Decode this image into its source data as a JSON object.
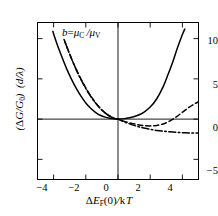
{
  "figure": {
    "annotation": "b = μ_C / μ_V",
    "annotation_parts": {
      "b": "b",
      "eq": "=",
      "mu_c": "μ",
      "sub_c": "C",
      "slash": "/",
      "mu_v": "μ",
      "sub_v": "V"
    },
    "xlabel": "ΔE_F(0) / kT",
    "ylabel": "(ΔG/G₀) (d/λ)"
  },
  "chart_data": {
    "type": "line",
    "title": "",
    "subtitle": "",
    "xlabel": "ΔE_F(0)/kT",
    "ylabel": "(ΔG/G_0)(d/λ)",
    "annotations": [
      "b = μ_C/μ_V"
    ],
    "grid": false,
    "legend": "none",
    "xlim": [
      -5,
      5
    ],
    "ylim": [
      -7.5,
      12
    ],
    "xticks": [
      -4,
      -2,
      0,
      2,
      4
    ],
    "yticks": [
      -5,
      0,
      5,
      10
    ],
    "xtick_labels": [
      "−4",
      "−2",
      "0",
      "2",
      "4"
    ],
    "ytick_labels": [
      "−5",
      "0",
      "5",
      "10"
    ],
    "axis_lines": {
      "x_zero": true,
      "y_zero": true
    },
    "series": [
      {
        "name": "solid",
        "style": "solid",
        "color": "#000000",
        "x": [
          -4.05,
          -3.8,
          -3.5,
          -3.2,
          -2.9,
          -2.6,
          -2.3,
          -2.0,
          -1.7,
          -1.4,
          -1.1,
          -0.8,
          -0.5,
          -0.25,
          0,
          0.4,
          0.8,
          1.2,
          1.6,
          2.0,
          2.4,
          2.8,
          3.1,
          3.4,
          3.7,
          4.0,
          4.15
        ],
        "y": [
          10.9,
          9.4,
          7.8,
          6.3,
          5.0,
          3.85,
          2.85,
          2.0,
          1.35,
          0.85,
          0.48,
          0.25,
          0.11,
          0.04,
          0.0,
          0.06,
          0.2,
          0.45,
          0.85,
          1.5,
          2.5,
          4.0,
          5.5,
          7.1,
          8.9,
          10.5,
          11.2
        ]
      },
      {
        "name": "dashed",
        "style": "dashed",
        "color": "#000000",
        "x": [
          -3.35,
          -3.1,
          -2.8,
          -2.5,
          -2.2,
          -1.9,
          -1.6,
          -1.3,
          -1.0,
          -0.7,
          -0.4,
          -0.2,
          0,
          0.4,
          0.8,
          1.2,
          1.6,
          2.0,
          2.4,
          2.8,
          3.2,
          3.6,
          4.0,
          4.4,
          4.8,
          5.0
        ],
        "y": [
          9.9,
          8.6,
          7.1,
          5.8,
          4.6,
          3.55,
          2.6,
          1.8,
          1.15,
          0.62,
          0.25,
          0.09,
          0.0,
          -0.28,
          -0.5,
          -0.68,
          -0.8,
          -0.84,
          -0.78,
          -0.6,
          -0.25,
          0.25,
          0.85,
          1.45,
          1.95,
          2.15
        ]
      },
      {
        "name": "dash-dot",
        "style": "dashdot",
        "color": "#000000",
        "x": [
          -3.3,
          -3.05,
          -2.75,
          -2.45,
          -2.15,
          -1.85,
          -1.55,
          -1.25,
          -0.95,
          -0.65,
          -0.35,
          -0.15,
          0,
          0.4,
          0.8,
          1.2,
          1.6,
          2.0,
          2.4,
          2.8,
          3.2,
          3.6,
          4.0,
          4.4,
          4.8,
          5.0
        ],
        "y": [
          9.6,
          8.3,
          6.85,
          5.5,
          4.35,
          3.3,
          2.4,
          1.65,
          1.02,
          0.55,
          0.2,
          0.06,
          0.0,
          -0.35,
          -0.65,
          -0.9,
          -1.1,
          -1.27,
          -1.4,
          -1.5,
          -1.58,
          -1.64,
          -1.68,
          -1.71,
          -1.73,
          -1.74
        ]
      }
    ]
  }
}
